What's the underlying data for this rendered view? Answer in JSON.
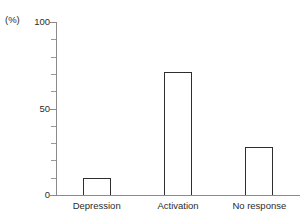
{
  "chart_data": {
    "type": "bar",
    "title": "",
    "subtitle": "",
    "xlabel": "",
    "ylabel": "(%)",
    "unit_label": "(%)",
    "categories": [
      "Depression",
      "Activation",
      "No response"
    ],
    "values": [
      10,
      71,
      28
    ],
    "ylim": [
      0,
      100
    ],
    "y_ticks_major": [
      0,
      50,
      100
    ],
    "y_tick_labels": [
      "0",
      "50",
      "100"
    ],
    "y_ticks_minor": [
      10,
      20,
      30,
      40,
      60,
      70,
      80,
      90
    ],
    "grid": false,
    "legend": null,
    "legend_position": "none",
    "annotations": [],
    "bar_style": {
      "fill": "#ffffff",
      "outline": "#2e2e2e",
      "outline_width_px": 1.6
    },
    "axis_color": "#8a8a8a",
    "text_color": "#2b2b2b"
  }
}
